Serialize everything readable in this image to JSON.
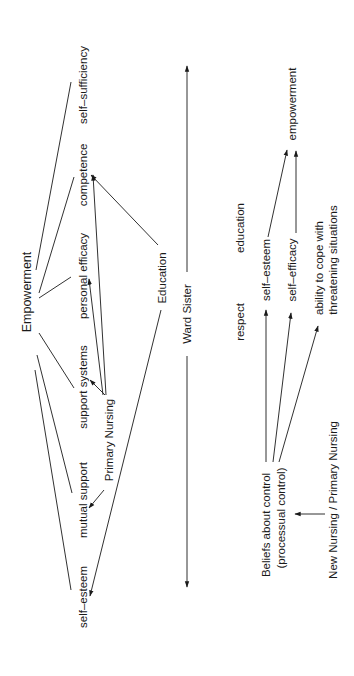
{
  "left_diagram": {
    "hub": "Empowerment",
    "components": [
      "self–sufficiency",
      "competence",
      "personal efficacy",
      "support systems",
      "mutual support",
      "self–esteem"
    ],
    "sources": {
      "primary_nursing": "Primary Nursing",
      "education": "Education"
    },
    "axis_label": "Ward Sister",
    "edges": [
      {
        "from": "Empowerment",
        "to": "self–sufficiency",
        "type": "line"
      },
      {
        "from": "Empowerment",
        "to": "competence",
        "type": "line"
      },
      {
        "from": "Empowerment",
        "to": "personal efficacy",
        "type": "line"
      },
      {
        "from": "Empowerment",
        "to": "support systems",
        "type": "line"
      },
      {
        "from": "Empowerment",
        "to": "mutual support",
        "type": "line"
      },
      {
        "from": "Empowerment",
        "to": "self–esteem",
        "type": "line"
      },
      {
        "from": "Primary Nursing",
        "to": "competence",
        "type": "arrow"
      },
      {
        "from": "Primary Nursing",
        "to": "personal efficacy",
        "type": "arrow"
      },
      {
        "from": "Primary Nursing",
        "to": "support systems",
        "type": "arrow"
      },
      {
        "from": "Primary Nursing",
        "to": "mutual support",
        "type": "arrow"
      },
      {
        "from": "Education",
        "to": "competence",
        "type": "arrow"
      },
      {
        "from": "Education",
        "to": "self–esteem",
        "type": "arrow"
      }
    ]
  },
  "right_diagram": {
    "top_labels": [
      "respect",
      "education"
    ],
    "source": {
      "line1": "Beliefs about control",
      "line2": "(processual control)"
    },
    "driver": "New Nursing / Primary Nursing",
    "outcomes": [
      "self–esteem",
      "self–efficacy",
      {
        "line1": "ability to cope with",
        "line2": "threatening situations"
      }
    ],
    "result": "empowerment",
    "edges": [
      {
        "from": "New Nursing / Primary Nursing",
        "to": "Beliefs about control"
      },
      {
        "from": "Beliefs about control",
        "to": "self–esteem"
      },
      {
        "from": "Beliefs about control",
        "to": "self–efficacy"
      },
      {
        "from": "Beliefs about control",
        "to": "ability to cope with threatening situations"
      },
      {
        "from": "self–esteem",
        "to": "empowerment"
      },
      {
        "from": "self–efficacy",
        "to": "empowerment"
      }
    ]
  }
}
